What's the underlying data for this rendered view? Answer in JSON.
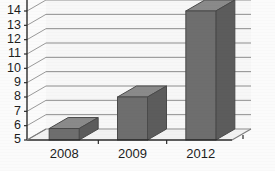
{
  "chart_data": {
    "type": "bar",
    "title": "",
    "subtitle": "",
    "xlabel": "",
    "ylabel": "",
    "categories": [
      "2008",
      "2009",
      "2012"
    ],
    "values": [
      5.8,
      8.0,
      14.0
    ],
    "series": [
      {
        "name": "",
        "values": [
          5.8,
          8.0,
          14.0
        ]
      }
    ],
    "ylim": [
      5,
      14
    ],
    "ytick_labels": [
      "5",
      "6",
      "7",
      "8",
      "9",
      "10",
      "11",
      "12",
      "13",
      "14"
    ],
    "ytick_values": [
      5,
      6,
      7,
      8,
      9,
      10,
      11,
      12,
      13,
      14
    ],
    "grid": true,
    "legend": false,
    "legend_position": "none",
    "three_d": true,
    "annotations": [],
    "colors": {
      "bar_fill": "#6e6e6e",
      "bar_edge": "#4a4a4a",
      "gridline": "#8d8d8d",
      "axis": "#2a2a2a",
      "plot_background": "#f7f7f7",
      "floor": "#f2f2f2",
      "text": "#1d1d1d"
    }
  }
}
